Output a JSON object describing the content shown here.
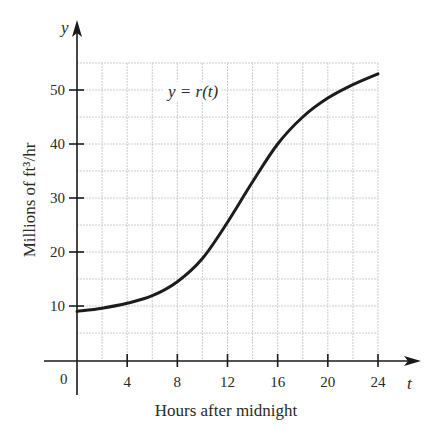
{
  "chart_data": {
    "type": "line",
    "title": "",
    "curve_label": "y = r(t)",
    "xlabel": "Hours after midnight",
    "ylabel": "Millions of ft³/hr",
    "x_axis_symbol": "t",
    "y_axis_symbol": "y",
    "origin_label": "0",
    "xlim": [
      0,
      24
    ],
    "ylim": [
      0,
      55
    ],
    "x_ticks": [
      4,
      8,
      12,
      16,
      20,
      24
    ],
    "y_ticks": [
      10,
      20,
      30,
      40,
      50
    ],
    "x_grid_step": 2,
    "y_grid_step": 5,
    "grid": true,
    "legend": "none",
    "series": [
      {
        "name": "r(t)",
        "x": [
          0,
          2,
          4,
          6,
          8,
          10,
          12,
          14,
          16,
          18,
          20,
          22,
          24
        ],
        "values": [
          9,
          9.6,
          10.5,
          11.9,
          14.5,
          18.8,
          25.5,
          33,
          40,
          45,
          48.5,
          51,
          53
        ]
      }
    ]
  },
  "colors": {
    "grid": "#b9c3c1",
    "axis": "#1a1a1a",
    "curve": "#1c1c1c",
    "text": "#2a2a2a",
    "background": "#ffffff"
  }
}
